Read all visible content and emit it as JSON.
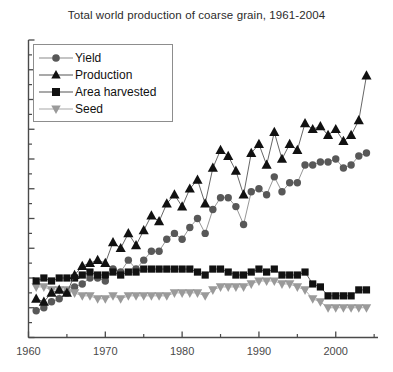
{
  "chart_data": {
    "type": "line",
    "title": "Total world production of coarse grain, 1961-2004",
    "xlabel": "",
    "ylabel": "",
    "xlim": [
      1960,
      2005.5
    ],
    "ylim": [
      0,
      100
    ],
    "xticks": [
      1960,
      1970,
      1980,
      1990,
      2000
    ],
    "xtick_labels": [
      "1960",
      "1970",
      "1980",
      "1990",
      "2000"
    ],
    "xminorticks": [
      1965,
      1975,
      1985,
      1995,
      2005
    ],
    "yticks_labeled": false,
    "ytick_count_major": 10,
    "ytick_count_minor": 10,
    "grid": false,
    "legend_position": "upper-left",
    "x": [
      1961,
      1962,
      1963,
      1964,
      1965,
      1966,
      1967,
      1968,
      1969,
      1970,
      1971,
      1972,
      1973,
      1974,
      1975,
      1976,
      1977,
      1978,
      1979,
      1980,
      1981,
      1982,
      1983,
      1984,
      1985,
      1986,
      1987,
      1988,
      1989,
      1990,
      1991,
      1992,
      1993,
      1994,
      1995,
      1996,
      1997,
      1998,
      1999,
      2000,
      2001,
      2002,
      2003,
      2004
    ],
    "series": [
      {
        "name": "Yield",
        "marker": "circle",
        "color": "#585858",
        "line_color": "#8a8a8a",
        "values": [
          9,
          10,
          12,
          13,
          15,
          17,
          18,
          20,
          20,
          19,
          23,
          22,
          26,
          23,
          26,
          29,
          29,
          33,
          35,
          33,
          37,
          40,
          35,
          43,
          47,
          47,
          44,
          38,
          49,
          50,
          48,
          54,
          49,
          52,
          52,
          58,
          58,
          59,
          59,
          60,
          57,
          58,
          61,
          62
        ]
      },
      {
        "name": "Production",
        "marker": "triangle-up",
        "color": "#111111",
        "line_color": "#555555",
        "values": [
          13,
          12,
          15,
          16,
          15,
          21,
          24,
          25,
          26,
          25,
          32,
          30,
          35,
          31,
          36,
          41,
          39,
          45,
          48,
          44,
          50,
          53,
          45,
          57,
          63,
          61,
          56,
          48,
          62,
          65,
          58,
          69,
          60,
          65,
          63,
          72,
          70,
          71,
          68,
          70,
          66,
          68,
          73,
          88
        ]
      },
      {
        "name": "Area harvested",
        "marker": "square",
        "color": "#111111",
        "line_color": "#555555",
        "values": [
          19,
          20,
          19,
          20,
          20,
          20,
          21,
          22,
          21,
          21,
          22,
          21,
          22,
          22,
          23,
          23,
          23,
          23,
          23,
          23,
          23,
          22,
          21,
          23,
          23,
          22,
          21,
          21,
          22,
          23,
          22,
          23,
          21,
          21,
          21,
          22,
          18,
          17,
          14,
          14,
          14,
          14,
          16,
          16
        ]
      },
      {
        "name": "Seed",
        "marker": "triangle-down",
        "color": "#9a9a9a",
        "line_color": "#a8a8a8",
        "values": [
          17,
          17,
          16,
          16,
          16,
          15,
          14,
          14,
          13,
          13,
          14,
          13,
          14,
          14,
          14,
          14,
          14,
          14,
          15,
          15,
          15,
          15,
          14,
          16,
          17,
          17,
          17,
          17,
          18,
          19,
          19,
          19,
          18,
          18,
          17,
          16,
          13,
          12,
          10,
          10,
          10,
          10,
          10,
          10
        ]
      }
    ]
  },
  "legend": {
    "items": [
      {
        "label": "Yield",
        "marker": "circle-icon"
      },
      {
        "label": "Production",
        "marker": "triangle-up-icon"
      },
      {
        "label": "Area harvested",
        "marker": "square-icon"
      },
      {
        "label": "Seed",
        "marker": "triangle-down-icon"
      }
    ]
  }
}
